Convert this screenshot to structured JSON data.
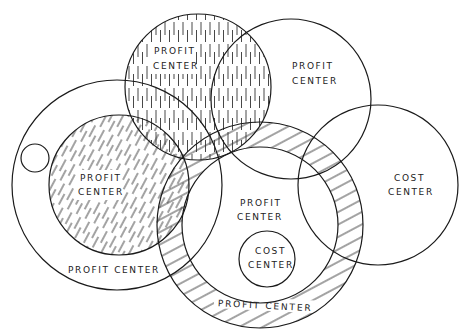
{
  "diagram": {
    "type": "venn-style organizational overlap diagram",
    "stroke_color": "#1a1a1a",
    "background": "#ffffff",
    "shapes": [
      {
        "id": "large-left",
        "label": "PROFIT CENTER",
        "hatch": "none",
        "cx": 117,
        "cy": 185,
        "r": 105
      },
      {
        "id": "inner-left",
        "label_line1": "PROFIT",
        "label_line2": "CENTER",
        "hatch": "diagonal-dashed",
        "cx": 119,
        "cy": 185,
        "r": 70
      },
      {
        "id": "small-left",
        "label": "",
        "hatch": "none",
        "cx": 35,
        "cy": 158,
        "r": 14
      },
      {
        "id": "top-left",
        "label_line1": "PROFIT",
        "label_line2": "CENTER",
        "hatch": "vertical-dashed",
        "cx": 198,
        "cy": 87,
        "r": 73
      },
      {
        "id": "top-right",
        "label_line1": "PROFIT",
        "label_line2": "CENTER",
        "hatch": "none",
        "cx": 291,
        "cy": 99,
        "r": 80
      },
      {
        "id": "right",
        "label_line1": "COST",
        "label_line2": "CENTER",
        "hatch": "none",
        "cx": 378,
        "cy": 185,
        "r": 80
      },
      {
        "id": "ring",
        "label": "PROFIT CENTER",
        "hatch": "diagonal-solid",
        "cx": 260,
        "cy": 225,
        "r_outer": 103,
        "r_inner": 78
      },
      {
        "id": "small-cost",
        "label_line1": "COST",
        "label_line2": "CENTER",
        "hatch": "none",
        "cx": 267,
        "cy": 259,
        "r": 28
      }
    ]
  },
  "labels": {
    "top_left_1": "PROFIT",
    "top_left_2": "CENTER",
    "top_right_1": "PROFIT",
    "top_right_2": "CENTER",
    "inner_left_1": "PROFIT",
    "inner_left_2": "CENTER",
    "large_left": "PROFIT CENTER",
    "middle_1": "PROFIT",
    "middle_2": "CENTER",
    "small_cost_1": "COST",
    "small_cost_2": "CENTER",
    "right_cost_1": "COST",
    "right_cost_2": "CENTER",
    "ring": "PROFIT CENTER"
  }
}
